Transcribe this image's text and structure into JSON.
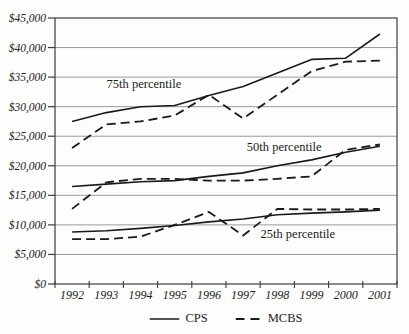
{
  "chart_data": {
    "type": "line",
    "title": "",
    "xlabel": "",
    "ylabel": "",
    "categories": [
      "1992",
      "1993",
      "1994",
      "1995",
      "1996",
      "1997",
      "1998",
      "1999",
      "2000",
      "2001"
    ],
    "ylim": [
      0,
      45000
    ],
    "ytick_interval": 5000,
    "ytick_labels": [
      "$0",
      "$5,000",
      "$10,000",
      "$15,000",
      "$20,000",
      "$25,000",
      "$30,000",
      "$35,000",
      "$40,000",
      "$45,000"
    ],
    "grid": "horizontal",
    "series": [
      {
        "name": "CPS",
        "percentile": "75th",
        "dash": "solid",
        "values": [
          27500,
          29000,
          30000,
          30200,
          31900,
          33400,
          35700,
          38000,
          38200,
          42300
        ]
      },
      {
        "name": "MCBS",
        "percentile": "75th",
        "dash": "dashed",
        "values": [
          23000,
          27000,
          27500,
          28500,
          32000,
          28000,
          32000,
          36000,
          37600,
          37800
        ]
      },
      {
        "name": "CPS",
        "percentile": "50th",
        "dash": "solid",
        "values": [
          16500,
          16900,
          17300,
          17500,
          18200,
          18800,
          20000,
          21000,
          22300,
          23300
        ]
      },
      {
        "name": "MCBS",
        "percentile": "50th",
        "dash": "dashed",
        "values": [
          12700,
          17200,
          17800,
          17800,
          17500,
          17500,
          17800,
          18200,
          22700,
          23600
        ]
      },
      {
        "name": "CPS",
        "percentile": "25th",
        "dash": "solid",
        "values": [
          8800,
          9000,
          9400,
          9900,
          10500,
          11000,
          11700,
          12000,
          12200,
          12500
        ]
      },
      {
        "name": "MCBS",
        "percentile": "25th",
        "dash": "dashed",
        "values": [
          7600,
          7600,
          8000,
          10000,
          12200,
          8200,
          12700,
          12600,
          12600,
          12700
        ]
      }
    ],
    "annotations": [
      {
        "text": "75th percentile",
        "year": 1994.1,
        "value": 33900
      },
      {
        "text": "50th percentile",
        "year": 1998.2,
        "value": 23100
      },
      {
        "text": "25th percentile",
        "year": 1998.6,
        "value": 8400
      }
    ],
    "legend": {
      "position": "bottom",
      "entries": [
        {
          "label": "CPS",
          "style": "solid"
        },
        {
          "label": "MCBS",
          "style": "dashed"
        }
      ]
    },
    "colors": {
      "line": "#1a1a1a",
      "gridline": "#9a9a9a",
      "frame": "#3d3d3d",
      "text": "#1f1f1f"
    }
  }
}
